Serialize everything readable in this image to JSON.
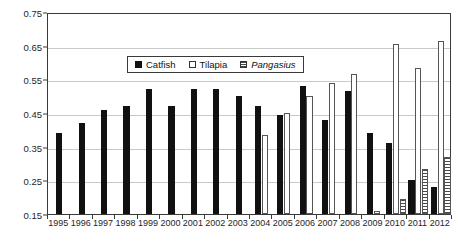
{
  "chart_data": {
    "type": "bar",
    "title": "",
    "subtitle": "",
    "xlabel": "",
    "ylabel": "",
    "ylim": [
      0.15,
      0.75
    ],
    "ytick_labels": [
      "0.75",
      "0.65",
      "0.55",
      "0.45",
      "0.35",
      "0.25",
      "0.15"
    ],
    "ytick_values": [
      0.75,
      0.65,
      0.55,
      0.45,
      0.35,
      0.25,
      0.15
    ],
    "grid": true,
    "grid_axis": "y",
    "legend_position": "top-center",
    "categories": [
      "1995",
      "1996",
      "1997",
      "1998",
      "1999",
      "2000",
      "2001",
      "2002",
      "2003",
      "2004",
      "2005",
      "2006",
      "2007",
      "2008",
      "2009",
      "2010",
      "2011",
      "2012"
    ],
    "series": [
      {
        "name": "Catfish",
        "style": "solid-black",
        "color": "#111111",
        "values": [
          0.39,
          0.42,
          0.46,
          0.47,
          0.52,
          0.47,
          0.52,
          0.52,
          0.5,
          0.47,
          0.445,
          0.53,
          0.43,
          0.515,
          0.39,
          0.36,
          0.25,
          0.23
        ]
      },
      {
        "name": "Tilapia",
        "style": "hollow-white",
        "color": "#ffffff",
        "values": [
          null,
          null,
          null,
          null,
          null,
          null,
          null,
          null,
          null,
          0.385,
          0.45,
          0.5,
          0.54,
          0.565,
          0.16,
          0.655,
          0.585,
          0.665
        ]
      },
      {
        "name": "Pangasius",
        "style": "horizontal-hatch",
        "italic": true,
        "color": "#ffffff",
        "values": [
          null,
          null,
          null,
          null,
          null,
          null,
          null,
          null,
          null,
          null,
          null,
          null,
          null,
          null,
          null,
          0.195,
          0.285,
          0.32
        ]
      }
    ]
  },
  "legend": {
    "items": [
      {
        "label": "Catfish",
        "swatch": "solid-black-square",
        "italic": false
      },
      {
        "label": "Tilapia",
        "swatch": "hollow-white-square",
        "italic": false
      },
      {
        "label": "Pangasius",
        "swatch": "hatched-square",
        "italic": true
      }
    ]
  }
}
